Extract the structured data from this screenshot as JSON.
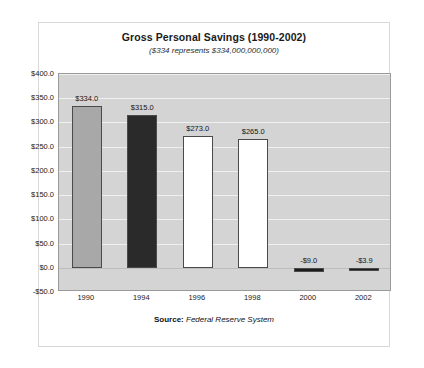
{
  "card": {
    "title": "Gross Personal Savings (1990-2002)",
    "subtitle": "($334 represents $334,000,000,000)",
    "source_label": "Source:",
    "source_value": "Federal Reserve System"
  },
  "chart_data": {
    "type": "bar",
    "title": "Gross Personal Savings (1990-2002)",
    "subtitle": "($334 represents $334,000,000,000)",
    "xlabel": "",
    "ylabel": "",
    "ylim": [
      -50,
      400
    ],
    "grid": true,
    "legend": "none",
    "categories": [
      "1990",
      "1994",
      "1996",
      "1998",
      "2000",
      "2002"
    ],
    "values": [
      334.0,
      315.0,
      273.0,
      265.0,
      -9.0,
      -3.9
    ],
    "data_labels": [
      "$334.0",
      "$315.0",
      "$273.0",
      "$265.0",
      "-$9.0",
      "-$3.9"
    ],
    "bar_colors": [
      "#a8a8a8",
      "#2a2a2a",
      "#ffffff",
      "#ffffff",
      "#1c1c1c",
      "#1c1c1c"
    ],
    "y_ticks": [
      400,
      350,
      300,
      250,
      200,
      150,
      100,
      50,
      0,
      -50
    ],
    "y_tick_labels": [
      "$400.0",
      "$350.0",
      "$300.0",
      "$250.0",
      "$200.0",
      "$150.0",
      "$100.0",
      "$50.0",
      "$0.0",
      "-$50.0"
    ],
    "plot_background": "#d4d4d4",
    "gridline_color": "#f0f0f0",
    "bar_border_color": "#4a4a4a",
    "source": "Federal Reserve System"
  }
}
